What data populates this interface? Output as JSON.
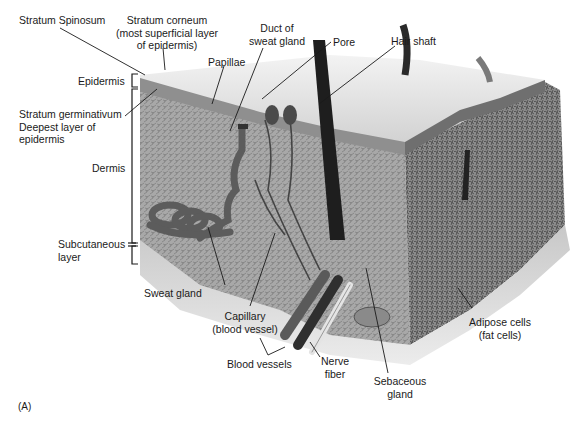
{
  "figure": {
    "tag": "(A)",
    "colors": {
      "background": "#ffffff",
      "epidermis": "#bdbdbd",
      "dermis": "#a9a9a9",
      "subcutaneous": "#d0d0d0",
      "hair": "#222222",
      "vessel_dark": "#3a3a3a",
      "vessel_mid": "#6a6a6a",
      "nerve": "#e8e8e8",
      "leader_line": "#1a1a1a"
    }
  },
  "labels": {
    "stratum_spinosum": "Stratum Spinosum",
    "stratum_corneum": [
      "Stratum corneum",
      "(most superficial layer",
      "of epidermis)"
    ],
    "duct_sweat_gland": [
      "Duct of",
      "sweat gland"
    ],
    "pore": "Pore",
    "hair_shaft": "Hair shaft",
    "papillae": "Papillae",
    "epidermis": "Epidermis",
    "stratum_germinativum": [
      "Stratum germinativum",
      "Deepest layer of",
      "epidermis"
    ],
    "dermis": "Dermis",
    "subcutaneous": [
      "Subcutaneous",
      "layer"
    ],
    "sweat_gland": "Sweat gland",
    "capillary": [
      "Capillary",
      "(blood vessel)"
    ],
    "blood_vessels": "Blood vessels",
    "nerve_fiber": [
      "Nerve",
      "fiber"
    ],
    "sebaceous_gland": [
      "Sebaceous",
      "gland"
    ],
    "adipose_cells": [
      "Adipose cells",
      "(fat cells)"
    ]
  }
}
